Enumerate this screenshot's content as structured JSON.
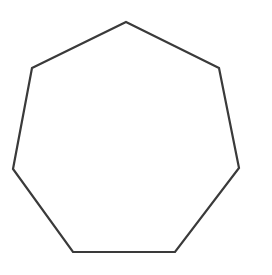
{
  "canvas": {
    "width": 272,
    "height": 275,
    "background_color": "#ffffff"
  },
  "figure": {
    "name": "heptagon",
    "label": "Heptagon",
    "side_count": 7,
    "fill": "none",
    "fill_color": "#ffffff",
    "stroke_color": "#3a3a3a",
    "stroke_width": 2.2,
    "vertices": [
      {
        "id": "top",
        "x": 126,
        "y": 22
      },
      {
        "id": "upper-right",
        "x": 219,
        "y": 68
      },
      {
        "id": "lower-right",
        "x": 239,
        "y": 168
      },
      {
        "id": "bottom-right",
        "x": 175,
        "y": 252
      },
      {
        "id": "bottom-left",
        "x": 73,
        "y": 252
      },
      {
        "id": "lower-left",
        "x": 13,
        "y": 169
      },
      {
        "id": "upper-left",
        "x": 32,
        "y": 68
      }
    ],
    "points_attr": "126,22 219,68 239,168 175,252 73,252 13,169 32,68"
  }
}
